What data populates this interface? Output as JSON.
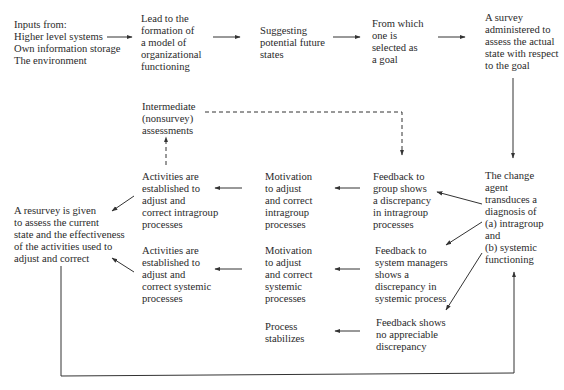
{
  "diagram": {
    "type": "flowchart",
    "nodes": {
      "inputs": "Inputs from:\nHigher level systems\nOwn information storage\nThe environment",
      "model": "Lead to the\nformation of\na model of\norganizational\nfunctioning",
      "future_states": "Suggesting\npotential future\nstates",
      "goal": "From which\none is\nselected as\na goal",
      "survey": "A survey\nadministered to\nassess the actual\nstate with respect\nto the goal",
      "intermediate": "Intermediate\n(nonsurvey)\nassessments",
      "activities_intragroup": "Activities are\nestablished to\nadjust and\ncorrect intragroup\nprocesses",
      "motivation_intragroup": "Motivation\nto adjust\nand correct\nintragroup\nprocesses",
      "feedback_group": "Feedback to\ngroup shows\na discrepancy\nin intragroup\nprocesses",
      "change_agent": "The change\nagent\ntransduces a\ndiagnosis of\n(a) intragroup\nand\n(b) systemic\nfunctioning",
      "resurvey": "A resurvey is given\nto assess the current\nstate and the effectiveness\nof the activities used to\nadjust and correct",
      "activities_systemic": "Activities are\nestablished to\nadjust and\ncorrect systemic\nprocesses",
      "motivation_systemic": "Motivation\nto adjust\nand correct\nsystemic\nprocesses",
      "feedback_system": "Feedback to\nsystem managers\nshows a\ndiscrepancy in\nsystemic process",
      "process_stabilizes": "Process\nstabilizes",
      "feedback_none": "Feedback shows\nno appreciable\ndiscrepancy"
    },
    "edges": [
      {
        "from": "inputs",
        "to": "model",
        "style": "solid"
      },
      {
        "from": "model",
        "to": "future_states",
        "style": "solid"
      },
      {
        "from": "future_states",
        "to": "goal",
        "style": "solid"
      },
      {
        "from": "goal",
        "to": "survey",
        "style": "solid"
      },
      {
        "from": "survey",
        "to": "change_agent",
        "style": "solid"
      },
      {
        "from": "change_agent",
        "to": "feedback_group",
        "style": "solid"
      },
      {
        "from": "change_agent",
        "to": "feedback_system",
        "style": "solid"
      },
      {
        "from": "change_agent",
        "to": "feedback_none",
        "style": "solid"
      },
      {
        "from": "feedback_group",
        "to": "motivation_intragroup",
        "style": "solid"
      },
      {
        "from": "motivation_intragroup",
        "to": "activities_intragroup",
        "style": "solid"
      },
      {
        "from": "activities_intragroup",
        "to": "resurvey",
        "style": "solid"
      },
      {
        "from": "activities_intragroup",
        "to": "intermediate",
        "style": "dashed"
      },
      {
        "from": "intermediate",
        "to": "feedback_group",
        "style": "dashed"
      },
      {
        "from": "feedback_system",
        "to": "motivation_systemic",
        "style": "solid"
      },
      {
        "from": "motivation_systemic",
        "to": "activities_systemic",
        "style": "solid"
      },
      {
        "from": "activities_systemic",
        "to": "resurvey",
        "style": "solid"
      },
      {
        "from": "feedback_none",
        "to": "process_stabilizes",
        "style": "solid"
      },
      {
        "from": "resurvey",
        "to": "change_agent",
        "style": "solid"
      }
    ]
  }
}
